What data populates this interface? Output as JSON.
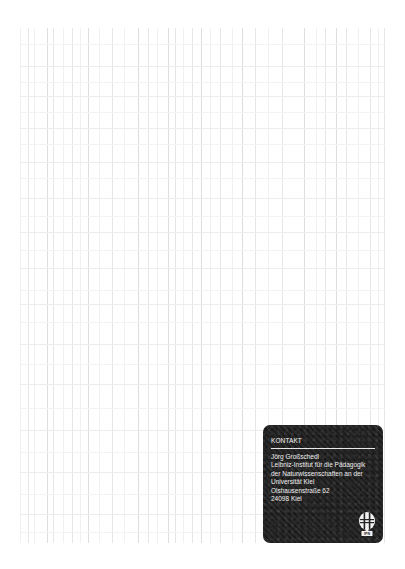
{
  "page": {
    "background": "#ffffff",
    "grid_color": "#e6e6e6"
  },
  "contact_card": {
    "title": "KONTAKT",
    "background": "#242424",
    "text_color": "#f0f0f0",
    "lines": [
      "Jörg Großschedl",
      "Leibniz-Institut für die Pädagogik",
      "der Naturwissenschaften an der",
      "Universität Kiel",
      "Olshausenstraße 62",
      "24098 Kiel"
    ],
    "logo": {
      "icon": "ipn-logo-icon",
      "label": "IPN"
    }
  }
}
